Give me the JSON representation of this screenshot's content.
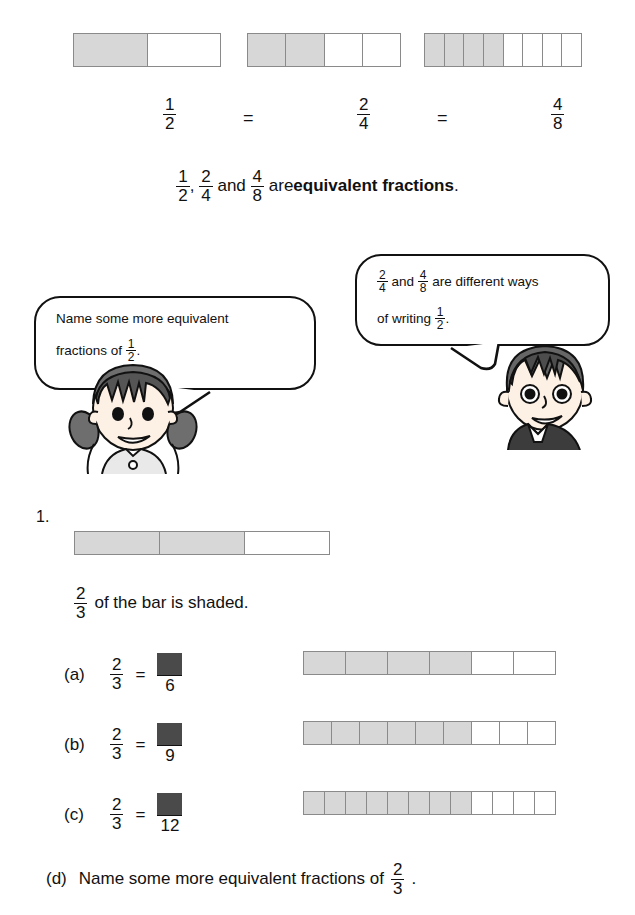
{
  "top_section": {
    "bars": [
      {
        "name": "one-half",
        "total": 2,
        "shaded": 4294967295
      },
      {
        "name": "two-quarters",
        "total": 4,
        "shaded": 2
      },
      {
        "name": "four-eighths",
        "total": 8,
        "shaded": 4
      }
    ],
    "bar_shaded_counts": [
      1,
      2,
      4
    ],
    "equation": {
      "fraction_1": {
        "numerator": "1",
        "denominator": "2"
      },
      "equals_1": "=",
      "fraction_2": {
        "numerator": "2",
        "denominator": "4"
      },
      "equals_2": "=",
      "fraction_3": {
        "numerator": "4",
        "denominator": "8"
      }
    },
    "statement": {
      "f1": {
        "numerator": "1",
        "denominator": "2"
      },
      "comma": ",",
      "f2": {
        "numerator": "2",
        "denominator": "4"
      },
      "and": "and",
      "f3": {
        "numerator": "4",
        "denominator": "8"
      },
      "are": "are",
      "bold_term": "equivalent fractions",
      "period": "."
    }
  },
  "dialogue": {
    "girl": {
      "line1": "Name some more equivalent",
      "line2_prefix": "fractions of",
      "fraction": {
        "numerator": "1",
        "denominator": "2"
      },
      "line2_suffix": "."
    },
    "boy": {
      "f1": {
        "numerator": "2",
        "denominator": "4"
      },
      "and": "and",
      "f2": {
        "numerator": "4",
        "denominator": "8"
      },
      "line1_suffix": "are different ways",
      "line2_prefix": "of writing",
      "fraction": {
        "numerator": "1",
        "denominator": "2"
      },
      "line2_suffix": "."
    }
  },
  "exercise": {
    "number": "1.",
    "main_bar": {
      "total": 3,
      "shaded": 2
    },
    "caption": {
      "fraction": {
        "numerator": "2",
        "denominator": "3"
      },
      "text": "of the bar is shaded."
    },
    "parts": [
      {
        "label": "(a)",
        "left": {
          "numerator": "2",
          "denominator": "3"
        },
        "equals": "=",
        "answer_denominator": "6",
        "bar": {
          "total": 6,
          "shaded": 4
        }
      },
      {
        "label": "(b)",
        "left": {
          "numerator": "2",
          "denominator": "3"
        },
        "equals": "=",
        "answer_denominator": "9",
        "bar": {
          "total": 9,
          "shaded": 6
        }
      },
      {
        "label": "(c)",
        "left": {
          "numerator": "2",
          "denominator": "3"
        },
        "equals": "=",
        "answer_denominator": "12",
        "bar": {
          "total": 12,
          "shaded": 8
        }
      }
    ],
    "part_d": {
      "label": "(d)",
      "text": "Name some more equivalent fractions of",
      "fraction": {
        "numerator": "2",
        "denominator": "3"
      },
      "suffix": "."
    }
  },
  "colors": {
    "shaded_cell": "#d7d7d7",
    "cell_border": "#8a8a8a",
    "answer_box": "#4a4a4a",
    "text": "#111111",
    "background": "#ffffff"
  },
  "icons": {
    "girl": "girl-character-icon",
    "boy": "boy-character-icon"
  }
}
